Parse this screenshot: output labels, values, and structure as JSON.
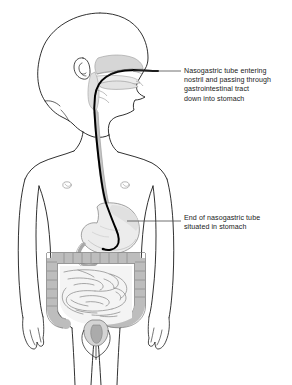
{
  "figure": {
    "background_color": "#ffffff",
    "outline_color": "#1a1a1a",
    "tube_color": "#000000",
    "organ_fill_light": "#f2f2f2",
    "organ_fill_mid": "#d9d9d9",
    "organ_fill_dark": "#bfbfbf",
    "leader_color": "#4d4d4d"
  },
  "annotations": [
    {
      "id": "nasogastric-entry",
      "text": "Nasogastric tube entering\nnostril and passing through\ngastrointestinal tract\ndown into stomach",
      "leader_from": "nose",
      "leader_to": "label"
    },
    {
      "id": "tube-end",
      "text": "End of nasogastric tube\nsituated in stomach",
      "leader_from": "stomach",
      "leader_to": "label"
    }
  ],
  "anatomy": {
    "parts": [
      "head",
      "ear",
      "nasal-cavity",
      "oral-cavity",
      "pharynx",
      "neck",
      "shoulders",
      "left-arm",
      "right-arm",
      "left-hand",
      "right-hand",
      "nipple-left",
      "nipple-right",
      "esophagus",
      "stomach",
      "duodenum",
      "small-intestine",
      "ascending-colon",
      "transverse-colon",
      "descending-colon",
      "sigmoid-colon",
      "rectum",
      "pelvis",
      "legs"
    ]
  },
  "device": {
    "name": "nasogastric-tube",
    "path_description": "enters nostril, passes through pharynx and esophagus, terminates in stomach"
  }
}
